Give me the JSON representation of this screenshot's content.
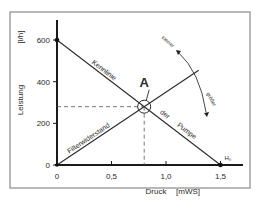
{
  "chart_data": {
    "type": "line",
    "title": "",
    "xlabel": "Druck",
    "xunit": "[mWS]",
    "ylabel": "Leistung",
    "yunit": "[l/h]",
    "xlim": [
      0,
      1.7
    ],
    "ylim": [
      0,
      700
    ],
    "x_ticks": [
      0,
      0.5,
      1.0,
      1.5
    ],
    "x_tick_labels": [
      "0",
      "0,5",
      "1,0",
      "1,5"
    ],
    "y_ticks": [
      0,
      200,
      400,
      600
    ],
    "y_tick_labels": [
      "0",
      "200",
      "400",
      "600"
    ],
    "series": [
      {
        "name": "Kennlinie der Pumpe",
        "label_parts": [
          "Kennlinie",
          "der",
          "Pumpe"
        ],
        "points": [
          [
            0,
            600
          ],
          [
            1.5,
            0
          ]
        ]
      },
      {
        "name": "Filterwiderstand",
        "label_parts": [
          "Filterwiderstand"
        ],
        "points": [
          [
            0,
            0
          ],
          [
            1.3,
            455
          ]
        ]
      }
    ],
    "operating_point": {
      "label": "A",
      "x": 0.8,
      "y": 280
    },
    "annotations": {
      "smaller": "kleiner",
      "larger": "größer",
      "shutoff_head": "H₀"
    },
    "grid": false
  }
}
